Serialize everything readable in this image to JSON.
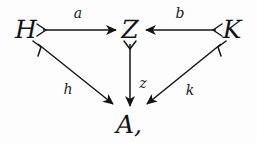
{
  "figure": {
    "kind": "commutative-diagram",
    "trailing_punctuation": ",",
    "ink_color": "#141414",
    "background_color": "#fdfdfd"
  },
  "objects": [
    {
      "id": "H",
      "label": "H",
      "x": 26,
      "y": 29
    },
    {
      "id": "Z",
      "label": "Z",
      "x": 130,
      "y": 29
    },
    {
      "id": "K",
      "label": "K",
      "x": 232,
      "y": 29
    },
    {
      "id": "A",
      "label": "A,",
      "x": 129,
      "y": 124
    }
  ],
  "morphisms": [
    {
      "id": "a",
      "label": "a",
      "from": "H",
      "to": "Z",
      "label_x": 78,
      "label_y": 13,
      "x1": 43,
      "y1": 30,
      "x2": 116,
      "y2": 30,
      "tail": "barb-right",
      "head": "arrow"
    },
    {
      "id": "b",
      "label": "b",
      "from": "K",
      "to": "Z",
      "label_x": 180,
      "label_y": 13,
      "x1": 216,
      "y1": 30,
      "x2": 146,
      "y2": 30,
      "tail": "barb-left",
      "head": "arrow"
    },
    {
      "id": "h",
      "label": "h",
      "from": "H",
      "to": "A",
      "label_x": 68,
      "label_y": 89,
      "x1": 38,
      "y1": 44,
      "x2": 113,
      "y2": 104,
      "tail": "barb-diag-down-right",
      "head": "arrow"
    },
    {
      "id": "z",
      "label": "z",
      "from": "Z",
      "to": "A",
      "label_x": 143,
      "label_y": 83,
      "x1": 130,
      "y1": 44,
      "x2": 130,
      "y2": 106,
      "tail": "barb-down",
      "head": "arrow"
    },
    {
      "id": "k",
      "label": "k",
      "from": "K",
      "to": "A",
      "label_x": 190,
      "label_y": 90,
      "x1": 221,
      "y1": 44,
      "x2": 147,
      "y2": 104,
      "tail": "barb-diag-down-left",
      "head": "arrow"
    }
  ]
}
